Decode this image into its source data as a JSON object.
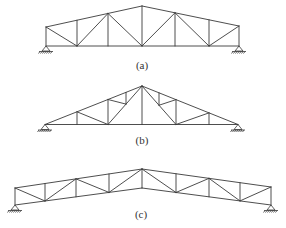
{
  "figure": {
    "line_color": "#3a3a3a",
    "trusses": [
      {
        "id": "a",
        "caption": "(a)",
        "type": "pitched truss with verticals and diagonals",
        "panels": 6,
        "supports": [
          "pin-left",
          "pin-right"
        ]
      },
      {
        "id": "b",
        "caption": "(b)",
        "type": "triangular (pitched) truss with sub-divided web",
        "panels": 6,
        "supports": [
          "pin-left",
          "pin-right"
        ]
      },
      {
        "id": "c",
        "caption": "(c)",
        "type": "inclined-chord (bow) truss with parallel chords",
        "panels": 8,
        "supports": [
          "pin-left",
          "pin-right"
        ]
      }
    ]
  }
}
